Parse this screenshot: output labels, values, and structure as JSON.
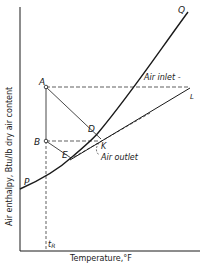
{
  "diagram": {
    "x_axis_label": "Temperature,°F",
    "y_axis_label": "Air enthalpy, Btu/lb dry air content",
    "points": {
      "A": "A",
      "B": "B",
      "D": "D",
      "E": "E",
      "K": "K",
      "P": "P",
      "Q": "Q",
      "L": "L"
    },
    "annotations": {
      "air_inlet": "Air inlet -",
      "air_outlet": "Air outlet",
      "t_R": "t",
      "t_R_sub": "R"
    },
    "colors": {
      "ink": "#1a1a1a",
      "background": "#ffffff"
    }
  }
}
